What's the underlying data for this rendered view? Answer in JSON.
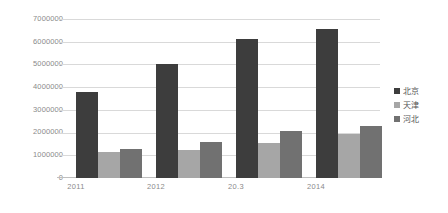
{
  "chart_data": {
    "type": "bar",
    "title": "",
    "xlabel": "",
    "ylabel": "",
    "categories": [
      "2011",
      "2012",
      "20.3",
      "2014"
    ],
    "series": [
      {
        "name": "北京",
        "color": "#3d3d3d",
        "values": [
          3800000,
          5050000,
          6150000,
          6600000
        ]
      },
      {
        "name": "天津",
        "color": "#a6a6a6",
        "values": [
          1150000,
          1250000,
          1550000,
          1950000
        ]
      },
      {
        "name": "河北",
        "color": "#717171",
        "values": [
          1300000,
          1600000,
          2100000,
          2300000
        ]
      }
    ],
    "ylim": [
      0,
      7000000
    ],
    "ytick_labels": [
      "7000000",
      "6000000",
      "5000000",
      "4000000",
      "3000000",
      "2000000",
      "1000000",
      "0"
    ],
    "ytick_values": [
      7000000,
      6000000,
      5000000,
      4000000,
      3000000,
      2000000,
      1000000,
      0
    ],
    "grid": true,
    "legend_position": "right",
    "legend_entries": [
      "北京",
      "天津",
      "河北"
    ]
  },
  "axes": {
    "y": {
      "t0": "7000000",
      "t1": "6000000",
      "t2": "5000000",
      "t3": "4000000",
      "t4": "3000000",
      "t5": "2000000",
      "t6": "1000000",
      "t7": "0"
    },
    "x": {
      "c0": "2011",
      "c1": "2012",
      "c2": "20.3",
      "c3": "2014"
    }
  },
  "legend": {
    "items": [
      {
        "label": "北京",
        "color": "#3d3d3d"
      },
      {
        "label": "天津",
        "color": "#a6a6a6"
      },
      {
        "label": "河北",
        "color": "#717171"
      }
    ]
  }
}
